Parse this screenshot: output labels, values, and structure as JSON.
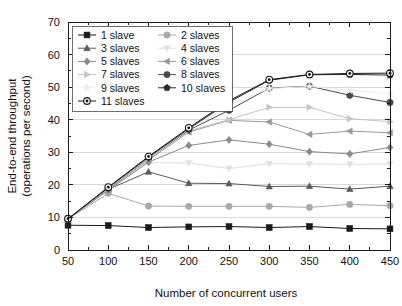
{
  "chart_data": {
    "type": "line",
    "title": "",
    "xlabel": "Number of concurrent users",
    "ylabel_line1": "End-to-end throughput",
    "ylabel_line2": "(operations per second)",
    "x": [
      50,
      100,
      150,
      200,
      250,
      300,
      350,
      400,
      450
    ],
    "xticks": [
      "50",
      "100",
      "150",
      "200",
      "250",
      "300",
      "350",
      "400",
      "450"
    ],
    "yticks": [
      "0",
      "10",
      "20",
      "30",
      "40",
      "50",
      "60",
      "70"
    ],
    "ytickvals": [
      0,
      10,
      20,
      30,
      40,
      50,
      60,
      70
    ],
    "xlim": [
      50,
      450
    ],
    "ylim": [
      0,
      70
    ],
    "grid": true,
    "legend_position": "upper-left-inside",
    "series": [
      {
        "name": "1 slave",
        "marker": "square",
        "color": "#1a1a1a",
        "values": [
          7.6,
          7.5,
          6.9,
          7.1,
          7.2,
          6.9,
          7.2,
          6.6,
          6.5
        ]
      },
      {
        "name": "2 slaves",
        "marker": "circle",
        "color": "#a8a8a8",
        "values": [
          9.5,
          17.4,
          13.5,
          13.4,
          13.4,
          13.4,
          13.1,
          14.0,
          13.6
        ]
      },
      {
        "name": "3 slaves",
        "marker": "triangle-up",
        "color": "#5a5a5a",
        "values": [
          9.5,
          18.6,
          24.0,
          20.5,
          20.4,
          19.5,
          19.6,
          18.7,
          19.6
        ]
      },
      {
        "name": "4 slaves",
        "marker": "triangle-down",
        "color": "#e0e0e0",
        "values": [
          9.5,
          18.5,
          26.8,
          26.7,
          25.0,
          26.5,
          26.4,
          26.3,
          26.4
        ]
      },
      {
        "name": "5 slaves",
        "marker": "diamond",
        "color": "#8a8a8a",
        "values": [
          9.5,
          18.3,
          27.0,
          32.1,
          33.8,
          32.5,
          30.2,
          29.5,
          31.5
        ]
      },
      {
        "name": "6 slaves",
        "marker": "triangle-left",
        "color": "#999999",
        "values": [
          9.5,
          18.6,
          27.6,
          36.2,
          39.8,
          39.3,
          35.5,
          36.5,
          36.0
        ]
      },
      {
        "name": "7 slaves",
        "marker": "triangle-right",
        "color": "#c4c4c4",
        "values": [
          9.5,
          18.7,
          28.0,
          36.6,
          40.0,
          43.8,
          43.8,
          40.3,
          39.4
        ]
      },
      {
        "name": "8 slaves",
        "marker": "circle",
        "color": "#4a4a4a",
        "values": [
          9.5,
          18.8,
          28.2,
          36.8,
          42.9,
          49.7,
          50.3,
          47.5,
          45.3
        ]
      },
      {
        "name": "9 slaves",
        "marker": "star",
        "color": "#ededed",
        "values": [
          9.5,
          18.9,
          28.3,
          37.0,
          44.5,
          49.6,
          50.2,
          49.0,
          48.0
        ]
      },
      {
        "name": "10 slaves",
        "marker": "pentagon",
        "color": "#2a2a2a",
        "values": [
          9.5,
          19.1,
          28.5,
          37.2,
          45.4,
          52.1,
          53.8,
          53.9,
          53.7
        ]
      },
      {
        "name": "11 slaves",
        "marker": "circle-dot",
        "color": "#1a1a1a",
        "values": [
          9.6,
          19.3,
          28.7,
          37.5,
          45.8,
          52.3,
          53.9,
          54.2,
          54.3
        ]
      }
    ],
    "legend_columns": [
      [
        "1 slave",
        "3 slaves",
        "5 slaves",
        "7 slaves",
        "9 slaves",
        "11 slaves"
      ],
      [
        "2 slaves",
        "4 slaves",
        "6 slaves",
        "8 slaves",
        "10 slaves"
      ]
    ]
  }
}
